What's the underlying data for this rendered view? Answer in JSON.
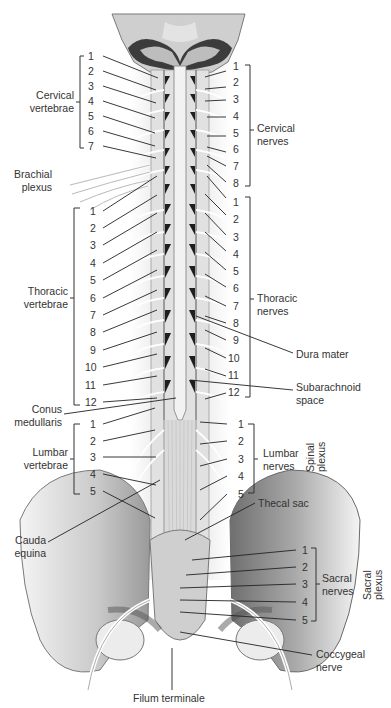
{
  "figure": {
    "colors": {
      "ink": "#333333",
      "bone": "#d8d8d8",
      "bone_dark": "#8a8a8a",
      "cord": "#e9e9e9",
      "nerve": "#f4f4f4",
      "shadow": "#1e1e1e"
    }
  },
  "left_groups": {
    "cervical_vertebrae": {
      "label_line1": "Cervical",
      "label_line2": "vertebrae",
      "numbers": [
        "1",
        "2",
        "3",
        "4",
        "5",
        "6",
        "7"
      ]
    },
    "brachial_plexus": {
      "label_line1": "Brachial",
      "label_line2": "plexus"
    },
    "thoracic_vertebrae": {
      "label_line1": "Thoracic",
      "label_line2": "vertebrae",
      "numbers": [
        "1",
        "2",
        "3",
        "4",
        "5",
        "6",
        "7",
        "8",
        "9",
        "10",
        "11",
        "12"
      ]
    },
    "conus_medullaris": {
      "label_line1": "Conus",
      "label_line2": "medullaris"
    },
    "lumbar_vertebrae": {
      "label_line1": "Lumbar",
      "label_line2": "vertebrae",
      "numbers": [
        "1",
        "2",
        "3",
        "4",
        "5"
      ]
    },
    "cauda_equina": {
      "label_line1": "Cauda",
      "label_line2": "equina"
    }
  },
  "right_groups": {
    "cervical_nerves": {
      "label_line1": "Cervical",
      "label_line2": "nerves",
      "numbers": [
        "1",
        "2",
        "3",
        "4",
        "5",
        "6",
        "7",
        "8"
      ]
    },
    "thoracic_nerves": {
      "label_line1": "Thoracic",
      "label_line2": "nerves",
      "numbers": [
        "1",
        "2",
        "3",
        "4",
        "5",
        "6",
        "7",
        "8",
        "9",
        "10",
        "11",
        "12"
      ]
    },
    "dura_mater": {
      "label": "Dura mater"
    },
    "subarachnoid_space": {
      "label_line1": "Subarachnoid",
      "label_line2": "space"
    },
    "lumbar_nerves": {
      "label_line1": "Lumbar",
      "label_line2": "nerves",
      "numbers": [
        "1",
        "2",
        "3",
        "4",
        "5"
      ]
    },
    "spinal_plexus": {
      "label_line1": "Spinal",
      "label_line2": "plexus"
    },
    "thecal_sac": {
      "label": "Thecal sac"
    },
    "sacral_nerves": {
      "label_line1": "Sacral",
      "label_line2": "nerves",
      "numbers": [
        "1",
        "2",
        "3",
        "4",
        "5"
      ]
    },
    "sacral_plexus": {
      "label_line1": "Sacral",
      "label_line2": "plexus"
    },
    "coccygeal_nerve": {
      "label_line1": "Coccygeal",
      "label_line2": "nerve"
    }
  },
  "bottom": {
    "filum_terminale": "Filum terminale"
  }
}
